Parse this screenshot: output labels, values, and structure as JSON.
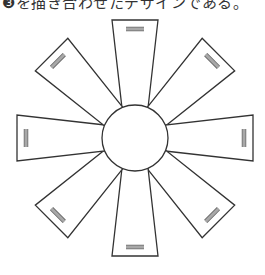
{
  "caption": "❸を描き合わせたデザインである。",
  "figure": {
    "panel_count": 8,
    "stroke_color": "#333333",
    "fill_color": "#ffffff",
    "bar_color": "#a8a8a8"
  }
}
